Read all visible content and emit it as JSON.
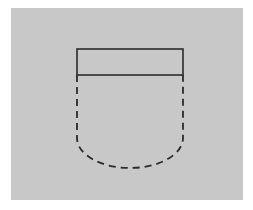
{
  "canvas": {
    "width": 253,
    "height": 210,
    "background_color": "#ffffff"
  },
  "panel": {
    "label": "figure-background-panel",
    "x": 11,
    "y": 8,
    "width": 232,
    "height": 192,
    "fill_color": "#c8c8c8",
    "border_color": "#c0c0c0"
  },
  "figure": {
    "stroke_color": "#2b2b2b",
    "solid_stroke_width": 1.6,
    "dashed_stroke_width": 1.8,
    "dash_pattern": "7,5",
    "rectangle": {
      "label": "top-rectangle",
      "x": 77,
      "y": 49,
      "width": 106,
      "height": 26,
      "left": 77,
      "right": 183,
      "top": 49,
      "bottom": 75
    },
    "hidden_outline": {
      "label": "dashed-u-shape",
      "left_x": 77,
      "right_x": 183,
      "top_y": 75,
      "straight_bottom_y": 138,
      "arc_bottom_y": 168,
      "arc_center_x": 130,
      "arc_radius_x": 53,
      "arc_radius_y": 30,
      "path": "M 77 75 L 77 138 A 53 30 0 0 0 183 138 L 183 75"
    }
  },
  "chart_data": {
    "type": "diagram",
    "elements": [
      {
        "name": "background-panel",
        "shape": "rectangle",
        "style": "filled",
        "x": 11,
        "y": 8,
        "width": 232,
        "height": 192,
        "fill": "#c8c8c8"
      },
      {
        "name": "top-rectangle",
        "shape": "rectangle",
        "style": "solid",
        "x": 77,
        "y": 49,
        "width": 106,
        "height": 26,
        "stroke": "#2b2b2b"
      },
      {
        "name": "hidden-body-outline",
        "shape": "u-curve",
        "style": "dashed",
        "left_x": 77,
        "right_x": 183,
        "top_y": 75,
        "bottom_y": 168,
        "stroke": "#2b2b2b"
      }
    ]
  }
}
